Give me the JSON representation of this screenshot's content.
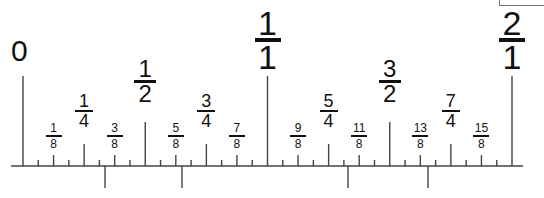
{
  "diagram": {
    "type": "fraction-number-line-ruler",
    "colors": {
      "line": "#444444",
      "text": "#111111",
      "background": "#ffffff",
      "frame": "#777777"
    },
    "geometry": {
      "baseline_y": 166,
      "baseline_x_start": 11,
      "baseline_x_end": 523,
      "origin_x": 23,
      "unit_px": 244.5
    },
    "zero_label": {
      "text": "0",
      "value": 0
    },
    "labels": [
      {
        "value": 0.125,
        "num": "1",
        "den": "8",
        "size": "eighth"
      },
      {
        "value": 0.25,
        "num": "1",
        "den": "4",
        "size": "quarter"
      },
      {
        "value": 0.375,
        "num": "3",
        "den": "8",
        "size": "eighth"
      },
      {
        "value": 0.5,
        "num": "1",
        "den": "2",
        "size": "half"
      },
      {
        "value": 0.625,
        "num": "5",
        "den": "8",
        "size": "eighth"
      },
      {
        "value": 0.75,
        "num": "3",
        "den": "4",
        "size": "quarter"
      },
      {
        "value": 0.875,
        "num": "7",
        "den": "8",
        "size": "eighth"
      },
      {
        "value": 1.0,
        "num": "1",
        "den": "1",
        "size": "whole"
      },
      {
        "value": 1.125,
        "num": "9",
        "den": "8",
        "size": "eighth"
      },
      {
        "value": 1.25,
        "num": "5",
        "den": "4",
        "size": "quarter"
      },
      {
        "value": 1.375,
        "num": "11",
        "den": "8",
        "size": "eighth"
      },
      {
        "value": 1.5,
        "num": "3",
        "den": "2",
        "size": "half"
      },
      {
        "value": 1.625,
        "num": "13",
        "den": "8",
        "size": "eighth"
      },
      {
        "value": 1.75,
        "num": "7",
        "den": "4",
        "size": "quarter"
      },
      {
        "value": 1.875,
        "num": "15",
        "den": "8",
        "size": "eighth"
      },
      {
        "value": 2.0,
        "num": "2",
        "den": "1",
        "size": "whole"
      }
    ],
    "tick_tops": {
      "whole": 76,
      "half": 122,
      "quarter": 144,
      "eighth": 155,
      "sixteenth": 160
    },
    "lower_ticks": [
      {
        "x": 105,
        "bottom": 188
      },
      {
        "x": 182,
        "bottom": 188
      },
      {
        "x": 348,
        "bottom": 188
      },
      {
        "x": 428,
        "bottom": 188
      }
    ]
  }
}
